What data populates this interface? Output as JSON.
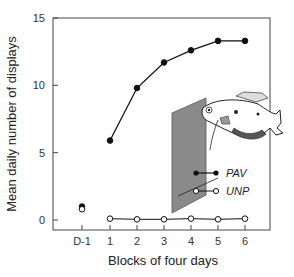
{
  "chart_data": {
    "type": "line",
    "title": "",
    "xlabel": "Blocks of four days",
    "ylabel": "Mean daily number of displays",
    "categories": [
      "D-1",
      "1",
      "2",
      "3",
      "4",
      "5",
      "6"
    ],
    "ylim": [
      0,
      15
    ],
    "yticks": [
      0,
      5,
      10,
      15
    ],
    "grid": false,
    "legend_position": "inside-right",
    "series": [
      {
        "name": "PAV",
        "marker": "filled-circle",
        "values": [
          1.0,
          5.9,
          9.8,
          11.7,
          12.6,
          13.3,
          13.3
        ],
        "connected_from_index": 1
      },
      {
        "name": "UNP",
        "marker": "open-circle",
        "values": [
          0.8,
          0.1,
          0.05,
          0.05,
          0.1,
          0.05,
          0.1
        ],
        "connected_from_index": 1
      }
    ],
    "annotations": [
      "illustration of a fish displaying at a grey panel (mirror)"
    ]
  },
  "legend": {
    "pav": "PAV",
    "unp": "UNP"
  },
  "axes": {
    "xlabel": "Blocks of four days",
    "ylabel": "Mean daily number of displays"
  }
}
